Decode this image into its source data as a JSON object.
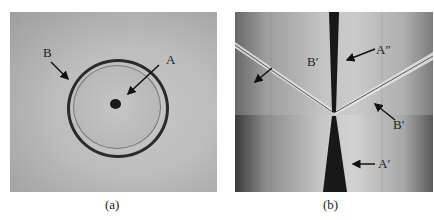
{
  "figure": {
    "panels": [
      {
        "id": "a",
        "caption": "(a)",
        "labels": {
          "A": "A",
          "B": "B"
        }
      },
      {
        "id": "b",
        "caption": "(b)",
        "labels": {
          "A_double_prime": "A″",
          "B_prime_left": "B′",
          "B_prime_right": "B′",
          "A_prime": "A′"
        }
      }
    ]
  }
}
